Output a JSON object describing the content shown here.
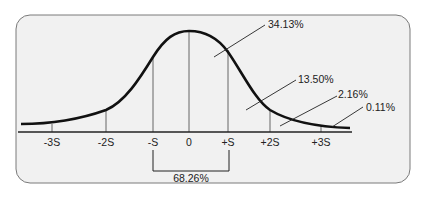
{
  "diagram": {
    "axis_ticks": [
      {
        "label": "-3S",
        "x": 52
      },
      {
        "label": "-2S",
        "x": 106
      },
      {
        "label": "-S",
        "x": 153
      },
      {
        "label": "0",
        "x": 189
      },
      {
        "label": "+S",
        "x": 228
      },
      {
        "label": "+2S",
        "x": 270
      },
      {
        "label": "+3S",
        "x": 321
      }
    ],
    "region_labels": {
      "one_sd": "34.13%",
      "two_sd": "13.50%",
      "three_sd": "2.16%",
      "tail": "0.11%"
    },
    "bracket_label": "68.26%",
    "colors": {
      "panel_bg": "#f1f1f1",
      "panel_border": "#7a7a7a",
      "curve": "#111111",
      "lines": "#333333"
    }
  }
}
